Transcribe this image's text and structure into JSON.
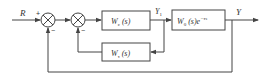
{
  "diagram": {
    "type": "block-diagram",
    "input": {
      "label": "R"
    },
    "output": {
      "label": "Y"
    },
    "intermediate": {
      "label": "Y",
      "subscript": "1"
    },
    "summers": [
      {
        "id": "sum1",
        "signs": {
          "input": "+",
          "feedback": "−"
        }
      },
      {
        "id": "sum2",
        "signs": {
          "feedback": "−"
        }
      }
    ],
    "blocks": [
      {
        "id": "controller",
        "main": "W",
        "sub": "c",
        "arg": " (s)",
        "exp": ""
      },
      {
        "id": "plant",
        "main": "W",
        "sub": "0",
        "arg": " (s)e",
        "exp": "−τs"
      },
      {
        "id": "feedback",
        "main": "W",
        "sub": "τ",
        "arg": " (s)",
        "exp": ""
      }
    ]
  },
  "colors": {
    "line": "#444444",
    "background": "#ffffff"
  }
}
